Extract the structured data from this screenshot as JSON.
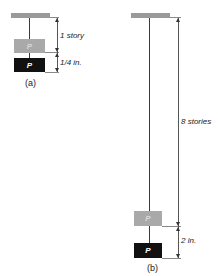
{
  "diagram_a": {
    "caption": "(a)",
    "box_label_gray": "P",
    "box_label_black": "P",
    "dim_upper": "1 story",
    "dim_lower": "1/4 in."
  },
  "diagram_b": {
    "caption": "(b)",
    "box_label_gray": "P",
    "box_label_black": "P",
    "dim_upper": "8 stories",
    "dim_lower": "2 in."
  },
  "colors": {
    "ceiling": "#9a9a9a",
    "box_gray": "#a9a9a9",
    "box_black": "#111111"
  }
}
